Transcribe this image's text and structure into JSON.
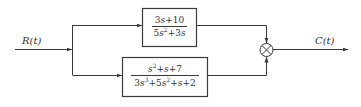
{
  "diagram": {
    "type": "block-diagram",
    "input": {
      "label": "R(t)"
    },
    "output": {
      "label": "C(t)"
    },
    "blocks": [
      {
        "id": "G1",
        "numerator": "3s+10",
        "denominator": "5s²+3s",
        "num_parts": {
          "a": "3",
          "b": "s",
          "c": "+10"
        },
        "den_parts": {
          "a": "5",
          "b": "s",
          "exp": "2",
          "c": "+3",
          "d": "s"
        }
      },
      {
        "id": "G2",
        "numerator": "s²+s+7",
        "denominator": "3s³+5s²+s+2",
        "num_parts": {
          "a": "s",
          "exp": "2",
          "b": "+",
          "c": "s",
          "d": "+7"
        },
        "den_parts": {
          "a": "3",
          "b": "s",
          "exp1": "3",
          "c": "+5",
          "d": "s",
          "exp2": "2",
          "e": "+",
          "f": "s",
          "g": "+2"
        }
      }
    ],
    "junction": {
      "type": "summing",
      "symbol": "⊗"
    },
    "colors": {
      "line": "#3a3a3a",
      "background": "#ffffff"
    }
  }
}
